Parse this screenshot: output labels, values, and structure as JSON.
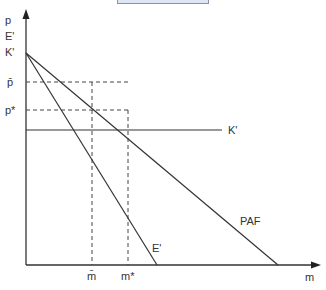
{
  "diagram": {
    "type": "economics-supply-demand",
    "axes": {
      "y_labels": [
        "p",
        "E'",
        "K'"
      ],
      "x_label": "m"
    },
    "price_levels": [
      {
        "label": "p̄",
        "name": "p-bar"
      },
      {
        "label": "p*",
        "name": "p-star"
      }
    ],
    "quantity_levels": [
      {
        "label": "m̄",
        "name": "m-bar"
      },
      {
        "label": "m*",
        "name": "m-star"
      }
    ],
    "curves": {
      "steep": "E'",
      "flat": "PAF",
      "horizontal": "K'"
    },
    "colors": {
      "line": "#333333",
      "dashed": "#444444",
      "box_fill": "#dde6f5",
      "box_border": "#8a93a3"
    }
  }
}
